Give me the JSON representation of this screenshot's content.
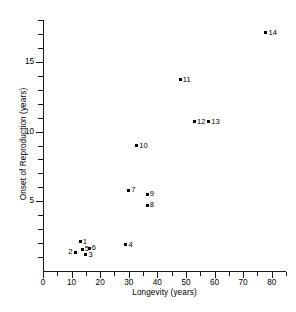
{
  "chart_data": {
    "type": "scatter",
    "title": "",
    "xlabel": "Longevity (years)",
    "ylabel": "Onset of Reproduction (years)",
    "xlim": [
      0,
      85
    ],
    "ylim": [
      0,
      18
    ],
    "xticks": [
      0,
      10,
      20,
      30,
      40,
      50,
      60,
      70,
      80
    ],
    "xticklabels": [
      "0",
      "10",
      "20",
      "30",
      "40",
      "50",
      "60",
      "70",
      "80"
    ],
    "xminor_step": 5,
    "yticks": [
      5,
      10,
      15
    ],
    "yticklabels": [
      "5",
      "10",
      "15"
    ],
    "yminor_step": 1,
    "grid": false,
    "legend": null,
    "marker": "filled-square",
    "points": [
      {
        "label": "1",
        "x": 13.0,
        "y": 2.1,
        "label_side": "right"
      },
      {
        "label": "2",
        "x": 11.2,
        "y": 1.35,
        "label_side": "left"
      },
      {
        "label": "3",
        "x": 15.0,
        "y": 1.15,
        "label_side": "right"
      },
      {
        "label": "4",
        "x": 29.0,
        "y": 1.9,
        "label_side": "right"
      },
      {
        "label": "5",
        "x": 13.7,
        "y": 1.55,
        "label_side": "right"
      },
      {
        "label": "6",
        "x": 16.2,
        "y": 1.62,
        "label_side": "right"
      },
      {
        "label": "7",
        "x": 30.0,
        "y": 5.8,
        "label_side": "right"
      },
      {
        "label": "8",
        "x": 36.5,
        "y": 4.7,
        "label_side": "right"
      },
      {
        "label": "9",
        "x": 36.5,
        "y": 5.5,
        "label_side": "right"
      },
      {
        "label": "10",
        "x": 32.8,
        "y": 9.0,
        "label_side": "right"
      },
      {
        "label": "11",
        "x": 48.0,
        "y": 13.7,
        "label_side": "right"
      },
      {
        "label": "12",
        "x": 53.0,
        "y": 10.7,
        "label_side": "right"
      },
      {
        "label": "13",
        "x": 58.0,
        "y": 10.7,
        "label_side": "right"
      },
      {
        "label": "14",
        "x": 78.0,
        "y": 17.1,
        "label_side": "right"
      }
    ]
  },
  "axes": {
    "x_title": "Longevity (years)",
    "y_title": "Onset of Reproduction (years)"
  },
  "colors": {
    "axis": "#1a1a1a",
    "marker": "#000000",
    "background": "#ffffff"
  }
}
